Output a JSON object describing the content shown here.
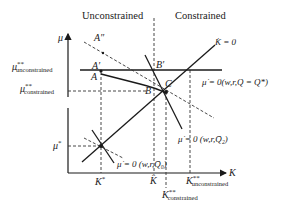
{
  "headers": {
    "left": "Unconstrained",
    "right": "Constrained"
  },
  "axes": {
    "y_label": "μ",
    "x_label": "K"
  },
  "y_ticks": {
    "mu_unconstrained": {
      "base": "μ",
      "sup": "**",
      "sub": "unconstrained"
    },
    "mu_constrained": {
      "base": "μ",
      "sup": "**",
      "sub": "constrained"
    },
    "mu_star": {
      "base": "μ",
      "sup": "*"
    }
  },
  "x_ticks": {
    "k_star": {
      "base": "K",
      "sup": "*"
    },
    "k_hat": {
      "base": "K̂"
    },
    "k_constrained": {
      "base": "K",
      "sup": "**",
      "sub": "constrained"
    },
    "k_unconstrained": {
      "base": "K",
      "sup": "**",
      "sub": "unconstrained"
    }
  },
  "points": {
    "a_double_prime": "A″",
    "a_prime": "A′",
    "a": "A",
    "b_prime": "B′",
    "b": "B",
    "c": "C"
  },
  "curves": {
    "k_dot": "K̇ = 0",
    "mu_dot_q_star": "μ̇ = 0(w,r,Q = Q*)",
    "mu_dot_q2": "μ̇ = 0 (w,r,Q̄₂)",
    "mu_dot_q0": "μ̇ = 0 (w,r,Q̄₀)"
  },
  "colors": {
    "line": "#1a1a1a",
    "dashed": "#333333",
    "background": "#ffffff"
  }
}
